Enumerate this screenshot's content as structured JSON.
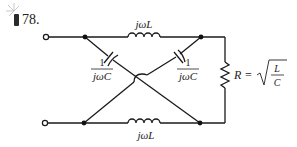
{
  "problem": {
    "number": "78.",
    "difficulty_icon": "bomb-icon"
  },
  "circuit": {
    "top_inductor_label": "jωL",
    "bottom_inductor_label": "jωL",
    "left_capacitor_label": {
      "numerator": "1",
      "denominator": "jωC"
    },
    "right_capacitor_label": {
      "numerator": "1",
      "denominator": "jωC"
    },
    "resistor_label": {
      "lhs": "R =",
      "num": "L",
      "den": "C"
    }
  },
  "colors": {
    "wire": "#1a1a1a",
    "text": "#222222",
    "background": "#ffffff"
  }
}
